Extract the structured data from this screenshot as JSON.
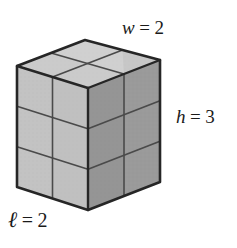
{
  "figure": {
    "kind": "rectangular-prism-unit-cubes",
    "dimensions": {
      "length": 2,
      "width": 2,
      "height": 3
    },
    "labels": {
      "width": {
        "var": "w",
        "eq": "=",
        "num": "2",
        "name": "w = 2"
      },
      "height": {
        "var": "h",
        "eq": "=",
        "num": "3",
        "name": "h = 3"
      },
      "length": {
        "var": "ℓ",
        "eq": "=",
        "num": "2",
        "name": "ℓ = 2"
      }
    },
    "colors": {
      "outline": "#262626",
      "gridline": "#4a4a4a",
      "top_face": "#cdcdcd",
      "left_face": "#c3c3c3",
      "right_face": "#9a9a9a",
      "background": "#ffffff",
      "text": "#1a1a1a"
    },
    "geometry": {
      "vertices": {
        "top_back": [
          85,
          40
        ],
        "top_left": [
          17,
          66
        ],
        "top_right": [
          160,
          60
        ],
        "top_front": [
          88,
          88
        ],
        "bottom_left": [
          17,
          187
        ],
        "bottom_front": [
          88,
          210
        ],
        "bottom_right": [
          160,
          182
        ]
      },
      "rows": 3,
      "cols_left": 2,
      "cols_right": 2,
      "top_grid": "2x2"
    }
  }
}
